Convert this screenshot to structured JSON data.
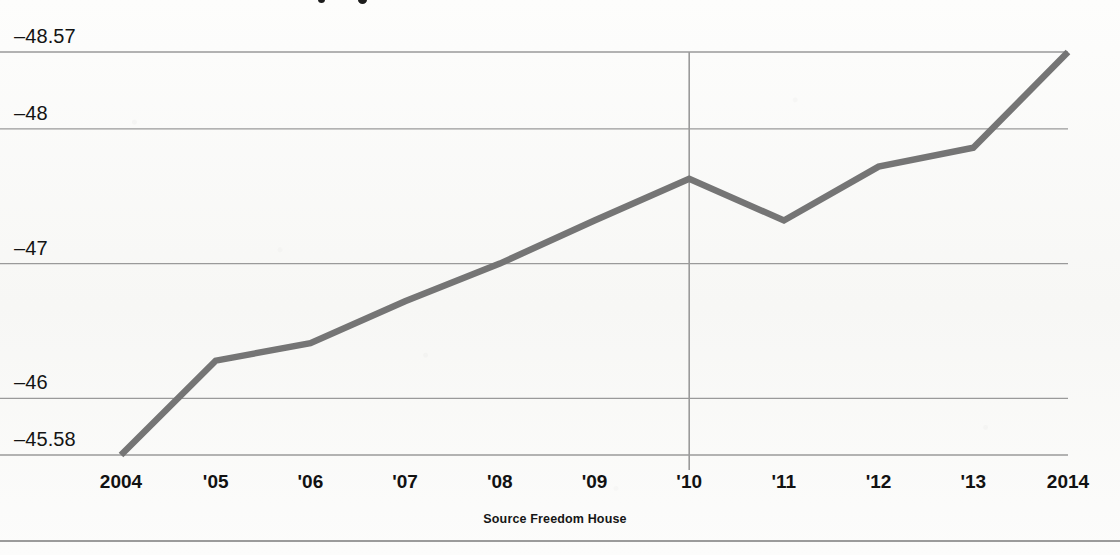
{
  "chart_data": {
    "type": "line",
    "title": "",
    "xlabel": "",
    "ylabel": "",
    "x": [
      2004,
      2005,
      2006,
      2007,
      2008,
      2009,
      2010,
      2011,
      2012,
      2013,
      2014
    ],
    "categories": [
      "2004",
      "'05",
      "'06",
      "'07",
      "'08",
      "'09",
      "'10",
      "'11",
      "'12",
      "'13",
      "2014"
    ],
    "values": [
      -45.58,
      -46.28,
      -46.41,
      -46.72,
      -47.0,
      -47.32,
      -47.63,
      -47.32,
      -47.72,
      -47.86,
      -48.57
    ],
    "series": [
      {
        "name": "Freedom House score",
        "values": [
          -45.58,
          -46.28,
          -46.41,
          -46.72,
          -47.0,
          -47.32,
          -47.63,
          -47.32,
          -47.72,
          -47.86,
          -48.57
        ]
      }
    ],
    "ylim": [
      -48.57,
      -45.58
    ],
    "yticks": [
      -45.58,
      -46,
      -47,
      -48,
      -48.57
    ],
    "ytick_labels": [
      "–45.58",
      "–46",
      "–47",
      "–48",
      "–48.57"
    ],
    "grid": true,
    "legend": false,
    "annotations": [
      {
        "name": "year-marker-2010",
        "x": 2010,
        "label": ""
      }
    ],
    "source": "Source Freedom House",
    "line_color": "#757575",
    "grid_color": "#9a9a9a",
    "text_color": "#141414"
  },
  "axes": {
    "y_ticks": [
      {
        "label": "–45.58",
        "value": -45.58
      },
      {
        "label": "–46",
        "value": -46
      },
      {
        "label": "–47",
        "value": -47
      },
      {
        "label": "–48",
        "value": -48
      },
      {
        "label": "–48.57",
        "value": -48.57
      }
    ],
    "x_ticks": [
      {
        "label": "2004",
        "value": 2004
      },
      {
        "label": "'05",
        "value": 2005
      },
      {
        "label": "'06",
        "value": 2006
      },
      {
        "label": "'07",
        "value": 2007
      },
      {
        "label": "'08",
        "value": 2008
      },
      {
        "label": "'09",
        "value": 2009
      },
      {
        "label": "'10",
        "value": 2010
      },
      {
        "label": "'11",
        "value": 2011
      },
      {
        "label": "'12",
        "value": 2012
      },
      {
        "label": "'13",
        "value": 2013
      },
      {
        "label": "2014",
        "value": 2014
      }
    ]
  },
  "footer": {
    "source_note": "Source Freedom House"
  }
}
